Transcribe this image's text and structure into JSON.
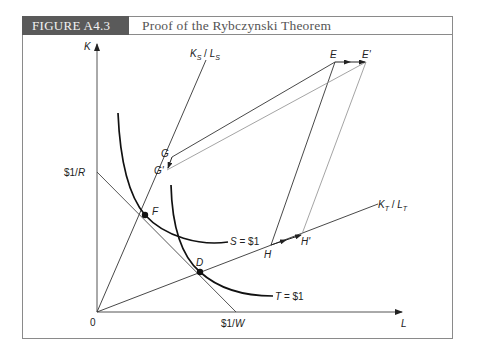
{
  "figure": {
    "label": "FIGURE A4.3",
    "title": "Proof of the Rybczynski Theorem"
  },
  "axes": {
    "y_label": "K",
    "x_label": "L",
    "origin_label": "0",
    "y_intercept_label": "$1/R",
    "x_intercept_label": "$1/W"
  },
  "rays": {
    "s_ray_label_num": "K",
    "s_ray_sub_num": "S",
    "s_ray_label_den": "L",
    "s_ray_sub_den": "S",
    "t_ray_label_num": "K",
    "t_ray_sub_num": "T",
    "t_ray_label_den": "L",
    "t_ray_sub_den": "T"
  },
  "isoquants": {
    "s_label": "S = $1",
    "t_label": "T = $1"
  },
  "points": {
    "F": "F",
    "D": "D",
    "G": "G",
    "G_prime": "G'",
    "E": "E",
    "E_prime": "E'",
    "H": "H",
    "H_prime": "H'"
  },
  "colors": {
    "header_bg": "#5a5a5a",
    "frame": "#8a8a8a",
    "line": "#222222",
    "shifted_line": "#9a9a9a"
  }
}
